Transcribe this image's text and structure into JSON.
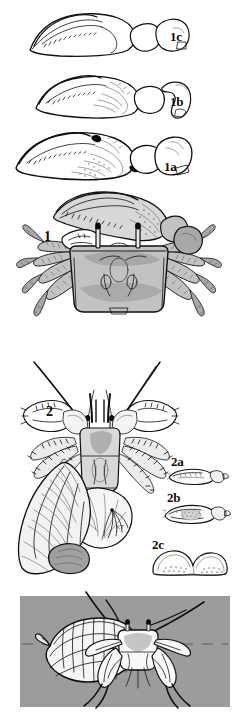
{
  "plate": {
    "type": "scientific-illustration-plate",
    "subject": "crustacean morphology: fiddler crab chelae and hermit crab",
    "background_color": "#ffffff",
    "line_color": "#111111",
    "artist_signature": "KT",
    "panel_gray": "#9c9c9c"
  },
  "figures": [
    {
      "id": "chela-1c",
      "label": "1c",
      "label_x": 170,
      "label_y": 30,
      "caption_position": "right-of-figure",
      "description": "major chela, lateral view, smooth outer surface"
    },
    {
      "id": "chela-1b",
      "label": "1b",
      "label_x": 170,
      "label_y": 95,
      "caption_position": "right-of-figure",
      "description": "major chela, lateral view, faint granulation"
    },
    {
      "id": "chela-1a",
      "label": "1a",
      "label_x": 164,
      "label_y": 160,
      "caption_position": "right-of-figure",
      "description": "major chela, lateral view, tubercles and dark spots"
    },
    {
      "id": "crab-whole-1",
      "label": "1",
      "label_x": 44,
      "label_y": 230,
      "caption_position": "left-of-figure",
      "description": "whole fiddler crab, dorsal view with enlarged left chela and stalked eyes"
    },
    {
      "id": "hermit-crab-2",
      "label": "2",
      "label_x": 46,
      "label_y": 405,
      "caption_position": "upper-left-of-figure",
      "description": "hermit crab removed from shell, dorsal view, with gastropod shell alongside"
    },
    {
      "id": "detail-2a",
      "label": "2a",
      "label_x": 171,
      "label_y": 455,
      "caption_position": "above-figure",
      "description": "chela detail, slender form"
    },
    {
      "id": "detail-2b",
      "label": "2b",
      "label_x": 167,
      "label_y": 491,
      "caption_position": "above-figure",
      "description": "chela detail, setose form"
    },
    {
      "id": "detail-2c",
      "label": "2c",
      "label_x": 152,
      "label_y": 538,
      "caption_position": "above-figure",
      "description": "dactyl / propodus detail with granules"
    },
    {
      "id": "hermit-crab-photo-panel",
      "label": "",
      "description": "hermit crab occupying gastropod shell on gray background panel with dashed horizon line"
    }
  ],
  "signature": {
    "text": "KT",
    "x": 116,
    "y": 524
  },
  "panel": {
    "x": 20,
    "y": 596,
    "width": 210,
    "height": 111,
    "fill": "#9c9c9c",
    "horizon_line": "dashed"
  }
}
